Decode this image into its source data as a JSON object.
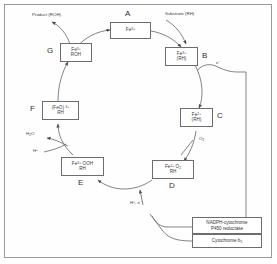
{
  "figure": {
    "frame_color": "#9a9a9a",
    "line_color": "#6d6d6d",
    "text_color": "#333333"
  },
  "cycle": {
    "nodes": [
      {
        "step": "A",
        "name": "ferric-enzyme",
        "lines": [
          "Fe 3+"
        ],
        "html": [
          "Fe<sup>3+</sup>"
        ]
      },
      {
        "step": "B",
        "name": "ferric-substrate-complex",
        "lines": [
          "Fe 3+",
          "(RH)"
        ],
        "html": [
          "Fe<sup>3+</sup>",
          "(RH)"
        ]
      },
      {
        "step": "C",
        "name": "ferrous-substrate-complex",
        "lines": [
          "Fe 2+",
          "(RH)"
        ],
        "html": [
          "Fe<sup>2+</sup>",
          "(RH)"
        ]
      },
      {
        "step": "D",
        "name": "ferrous-dioxygen-complex",
        "lines": [
          "Fe 2+ O2",
          "RH"
        ],
        "html": [
          "Fe<sup>2+</sup> O<sub>2</sub>",
          "RH"
        ]
      },
      {
        "step": "E",
        "name": "ferric-hydroperoxo-complex",
        "lines": [
          "Fe 3+ OOH",
          "RH"
        ],
        "html": [
          "Fe<sup>3+</sup> OOH",
          "RH"
        ]
      },
      {
        "step": "F",
        "name": "perferryl-oxo-complex",
        "lines": [
          "(FeO) 3+",
          "RH"
        ],
        "html": [
          "(FeO) <sup>3+</sup>",
          "RH"
        ]
      },
      {
        "step": "G",
        "name": "ferric-product-complex",
        "lines": [
          "Fe 3+",
          "ROH"
        ],
        "html": [
          "Fe<sup>3+</sup>",
          "ROH"
        ]
      }
    ]
  },
  "annotations": {
    "product": {
      "text": "Product (ROH)",
      "html": "Product (ROH)"
    },
    "substrate": {
      "text": "Substrate (RH)",
      "html": "Substrate (RH)"
    },
    "electron_right": {
      "text": "e-",
      "html": "e<sup>−</sup>"
    },
    "oxygen": {
      "text": "O2",
      "html": "O<sub>2</sub>"
    },
    "water": {
      "text": "H2O",
      "html": "H<sub>2</sub>O"
    },
    "proton_left": {
      "text": "H+",
      "html": "H<sup>+</sup>"
    },
    "proton_electron_bottom": {
      "text": "H+, e-",
      "html": "H<sup>+</sup>, e<sup>−</sup>"
    }
  },
  "electron_donors": [
    {
      "name": "nadph-cytochrome-p450-reductase",
      "lines": [
        "NADPH-cytochrome",
        "P450 reductase"
      ]
    },
    {
      "name": "cytochrome-b5",
      "lines": [
        "Cytochrome b5"
      ],
      "html": [
        "Cytochrome b<sub>5</sub>"
      ]
    }
  ]
}
